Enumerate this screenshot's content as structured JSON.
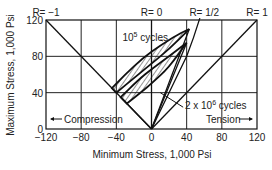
{
  "chart_data": {
    "type": "line",
    "title": "",
    "xlabel": "Minimum Stress, 1,000 Psi",
    "ylabel": "Maximum Stress, 1,000 Psi",
    "xlim": [
      -120,
      120
    ],
    "ylim": [
      0,
      120
    ],
    "grid": true,
    "x_ticks": [
      "-120",
      "-80",
      "-40",
      "0",
      "40",
      "80",
      "120"
    ],
    "y_ticks": [
      "0",
      "40",
      "80",
      "120"
    ],
    "x_tick_values": [
      -120,
      -80,
      -40,
      0,
      40,
      80,
      120
    ],
    "y_tick_values": [
      0,
      40,
      80,
      120
    ],
    "stress_ratio_lines": [
      {
        "name": "R = -1",
        "label": "R= −1",
        "x": [
          0,
          -120
        ],
        "y": [
          0,
          120
        ]
      },
      {
        "name": "R = 0",
        "label": "R= 0",
        "x": [
          0,
          0
        ],
        "y": [
          0,
          120
        ]
      },
      {
        "name": "R = 1/2",
        "label": "R= 1/2",
        "x": [
          0,
          60
        ],
        "y": [
          0,
          120
        ]
      },
      {
        "name": "R = 1",
        "label": "R= 1",
        "x": [
          0,
          120
        ],
        "y": [
          0,
          120
        ]
      }
    ],
    "series": [
      {
        "name": "10^5 cycles",
        "label_base": "10",
        "label_exp": "5",
        "label_suffix": " cycles",
        "upper": {
          "x": [
            -45,
            -30,
            -10,
            10,
            30,
            43
          ],
          "y": [
            45,
            60,
            78,
            92,
            104,
            110
          ]
        },
        "lower": {
          "x": [
            -40,
            -20,
            0,
            20,
            43
          ],
          "y": [
            40,
            56,
            72,
            88,
            110
          ]
        }
      },
      {
        "name": "2 x 10^6 cycles",
        "label_base": "2 x 10",
        "label_exp": "6",
        "label_suffix": " cycles",
        "upper": {
          "x": [
            -35,
            -15,
            0,
            20,
            40
          ],
          "y": [
            35,
            54,
            66,
            80,
            95
          ]
        },
        "lower": {
          "x": [
            -28,
            -10,
            0,
            20,
            40
          ],
          "y": [
            28,
            42,
            50,
            68,
            95
          ]
        }
      }
    ],
    "annotations": {
      "compression": "Compression",
      "tension": "Tension"
    },
    "legend": "none"
  }
}
